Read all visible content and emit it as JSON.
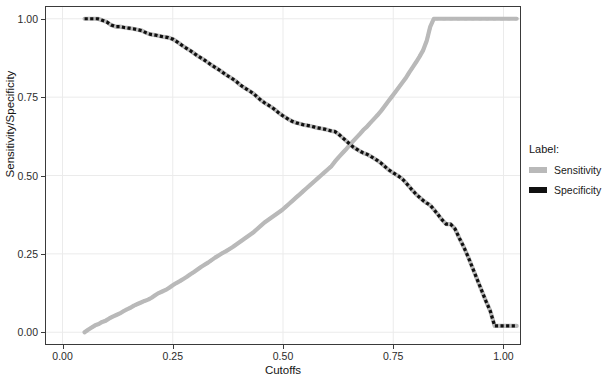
{
  "chart_data": {
    "type": "line",
    "title": "",
    "xlabel": "Cutoffs",
    "ylabel": "Sensitivity/Specificity",
    "xlim": [
      -0.0375,
      1.0375
    ],
    "ylim": [
      -0.0375,
      1.0375
    ],
    "xticks": [
      0.0,
      0.25,
      0.5,
      0.75,
      1.0
    ],
    "xtick_labels": [
      "0.00",
      "0.25",
      "0.50",
      "0.75",
      "1.00"
    ],
    "yticks": [
      0.0,
      0.25,
      0.5,
      0.75,
      1.0
    ],
    "ytick_labels": [
      "0.00",
      "0.25",
      "0.50",
      "0.75",
      "1.00"
    ],
    "grid": true,
    "grid_color": "#ebebeb",
    "panel_border_color": "#3a3a3a",
    "legend": {
      "position": "right",
      "title": "Label:",
      "entries": [
        {
          "name": "Sensitivity",
          "color": "#b9b9b9"
        },
        {
          "name": "Specificity",
          "color": "#101010"
        }
      ]
    },
    "series": [
      {
        "name": "Sensitivity",
        "color": "#b9b9b9",
        "x": [
          0.05,
          0.058,
          0.066,
          0.074,
          0.082,
          0.09,
          0.098,
          0.106,
          0.114,
          0.122,
          0.13,
          0.138,
          0.146,
          0.154,
          0.162,
          0.17,
          0.178,
          0.186,
          0.194,
          0.202,
          0.21,
          0.218,
          0.226,
          0.234,
          0.242,
          0.25,
          0.258,
          0.266,
          0.274,
          0.282,
          0.29,
          0.298,
          0.306,
          0.314,
          0.322,
          0.33,
          0.338,
          0.346,
          0.354,
          0.362,
          0.37,
          0.378,
          0.386,
          0.394,
          0.402,
          0.41,
          0.418,
          0.426,
          0.434,
          0.442,
          0.45,
          0.458,
          0.466,
          0.474,
          0.482,
          0.49,
          0.498,
          0.506,
          0.514,
          0.522,
          0.53,
          0.538,
          0.546,
          0.554,
          0.562,
          0.57,
          0.578,
          0.586,
          0.594,
          0.602,
          0.61,
          0.618,
          0.626,
          0.634,
          0.642,
          0.65,
          0.658,
          0.666,
          0.674,
          0.682,
          0.69,
          0.698,
          0.706,
          0.714,
          0.722,
          0.73,
          0.738,
          0.746,
          0.754,
          0.762,
          0.77,
          0.778,
          0.786,
          0.794,
          0.802,
          0.81,
          0.818,
          0.826,
          0.834,
          0.842,
          0.87,
          0.9,
          0.93,
          0.96,
          0.99,
          1.03
        ],
        "y": [
          0.0,
          0.008,
          0.015,
          0.022,
          0.026,
          0.033,
          0.037,
          0.044,
          0.05,
          0.055,
          0.06,
          0.067,
          0.073,
          0.078,
          0.085,
          0.09,
          0.095,
          0.1,
          0.104,
          0.11,
          0.118,
          0.125,
          0.13,
          0.135,
          0.142,
          0.15,
          0.157,
          0.163,
          0.17,
          0.177,
          0.185,
          0.192,
          0.2,
          0.208,
          0.215,
          0.222,
          0.23,
          0.238,
          0.245,
          0.252,
          0.258,
          0.265,
          0.272,
          0.28,
          0.288,
          0.296,
          0.304,
          0.312,
          0.32,
          0.33,
          0.34,
          0.35,
          0.358,
          0.366,
          0.374,
          0.382,
          0.39,
          0.4,
          0.41,
          0.42,
          0.43,
          0.44,
          0.45,
          0.46,
          0.47,
          0.48,
          0.49,
          0.5,
          0.51,
          0.52,
          0.53,
          0.545,
          0.558,
          0.57,
          0.582,
          0.595,
          0.608,
          0.62,
          0.632,
          0.645,
          0.655,
          0.668,
          0.68,
          0.692,
          0.705,
          0.72,
          0.735,
          0.75,
          0.765,
          0.78,
          0.795,
          0.81,
          0.828,
          0.845,
          0.862,
          0.88,
          0.9,
          0.93,
          0.975,
          1.0,
          1.0,
          1.0,
          1.0,
          1.0,
          1.0,
          1.0
        ]
      },
      {
        "name": "Specificity",
        "color": "#101010",
        "x": [
          0.05,
          0.06,
          0.07,
          0.08,
          0.09,
          0.1,
          0.11,
          0.12,
          0.13,
          0.14,
          0.15,
          0.16,
          0.17,
          0.18,
          0.19,
          0.2,
          0.21,
          0.22,
          0.23,
          0.24,
          0.25,
          0.258,
          0.266,
          0.274,
          0.282,
          0.29,
          0.298,
          0.306,
          0.314,
          0.322,
          0.33,
          0.338,
          0.346,
          0.354,
          0.362,
          0.37,
          0.378,
          0.386,
          0.394,
          0.402,
          0.41,
          0.418,
          0.426,
          0.434,
          0.442,
          0.45,
          0.458,
          0.466,
          0.474,
          0.482,
          0.49,
          0.498,
          0.506,
          0.514,
          0.522,
          0.53,
          0.538,
          0.546,
          0.554,
          0.562,
          0.57,
          0.578,
          0.586,
          0.594,
          0.602,
          0.61,
          0.618,
          0.626,
          0.634,
          0.642,
          0.65,
          0.658,
          0.666,
          0.674,
          0.682,
          0.69,
          0.698,
          0.706,
          0.714,
          0.722,
          0.73,
          0.738,
          0.746,
          0.754,
          0.762,
          0.77,
          0.778,
          0.786,
          0.794,
          0.802,
          0.81,
          0.818,
          0.826,
          0.834,
          0.842,
          0.85,
          0.86,
          0.87,
          0.88,
          0.89,
          0.9,
          0.91,
          0.92,
          0.93,
          0.94,
          0.95,
          0.96,
          0.97,
          0.98,
          1.03
        ],
        "y": [
          1.0,
          1.0,
          1.0,
          1.0,
          0.995,
          0.99,
          0.98,
          0.975,
          0.975,
          0.972,
          0.97,
          0.968,
          0.965,
          0.962,
          0.955,
          0.95,
          0.948,
          0.945,
          0.942,
          0.94,
          0.935,
          0.928,
          0.92,
          0.912,
          0.905,
          0.898,
          0.89,
          0.882,
          0.875,
          0.868,
          0.86,
          0.852,
          0.845,
          0.838,
          0.83,
          0.822,
          0.815,
          0.808,
          0.8,
          0.79,
          0.782,
          0.775,
          0.768,
          0.76,
          0.75,
          0.74,
          0.732,
          0.725,
          0.718,
          0.71,
          0.7,
          0.692,
          0.685,
          0.678,
          0.672,
          0.668,
          0.665,
          0.662,
          0.66,
          0.658,
          0.655,
          0.652,
          0.65,
          0.648,
          0.645,
          0.642,
          0.64,
          0.632,
          0.622,
          0.612,
          0.602,
          0.592,
          0.585,
          0.578,
          0.572,
          0.568,
          0.562,
          0.555,
          0.548,
          0.54,
          0.53,
          0.52,
          0.512,
          0.505,
          0.498,
          0.49,
          0.478,
          0.465,
          0.452,
          0.44,
          0.43,
          0.42,
          0.412,
          0.405,
          0.392,
          0.378,
          0.36,
          0.345,
          0.345,
          0.33,
          0.3,
          0.272,
          0.24,
          0.205,
          0.17,
          0.135,
          0.1,
          0.068,
          0.02,
          0.02
        ]
      }
    ],
    "annotations": [
      {
        "text": "curves cross near cutoff 0.46 at value 0.72"
      }
    ]
  }
}
